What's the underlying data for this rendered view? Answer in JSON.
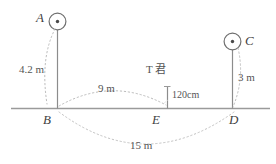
{
  "diagram": {
    "title_text": "",
    "baseline_color": "#9a9a9a",
    "pole_color": "#8c8c8c",
    "dash_color": "#b9b9b9",
    "text_color": "#4a4a4a",
    "points": [
      {
        "id": "A",
        "label": "A",
        "marker": "circle-dot-marker"
      },
      {
        "id": "B",
        "label": "B",
        "marker": "baseline-point"
      },
      {
        "id": "C",
        "label": "C",
        "marker": "circle-dot-marker"
      },
      {
        "id": "D",
        "label": "D",
        "marker": "baseline-point"
      },
      {
        "id": "E",
        "label": "E",
        "marker": "baseline-point"
      }
    ],
    "measurements": [
      {
        "id": "ab",
        "label": "4.2 m",
        "from": "A",
        "to": "B"
      },
      {
        "id": "be",
        "label": "9 m",
        "from": "B",
        "to": "E"
      },
      {
        "id": "te",
        "label": "120cm",
        "from": "T",
        "to": "E"
      },
      {
        "id": "cd",
        "label": "3 m",
        "from": "C",
        "to": "D"
      },
      {
        "id": "bd",
        "label": "15 m",
        "from": "B",
        "to": "D"
      }
    ],
    "person": {
      "label": "T 君",
      "height_label": "120cm"
    }
  }
}
